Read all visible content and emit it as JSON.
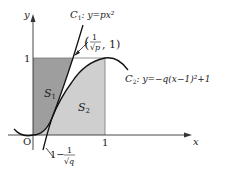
{
  "diagram": {
    "axes": {
      "x_label": "x",
      "y_label": "y",
      "origin_label": "O",
      "x_tick_1": "1",
      "y_tick_1": "1"
    },
    "curves": {
      "c1": {
        "name": "C",
        "sub": "1",
        "equation": ": y=px²"
      },
      "c2": {
        "name": "C",
        "sub": "2",
        "equation": ": y=−q(x−1)²+1"
      }
    },
    "point": {
      "open": "(",
      "num": "1",
      "den": "√p",
      "tail": ", 1)"
    },
    "x_point": {
      "lead": "1−",
      "num": "1",
      "den": "√q"
    },
    "regions": {
      "s1": {
        "name": "S",
        "sub": "1",
        "fill": "#9e9e9e"
      },
      "s2": {
        "name": "S",
        "sub": "2",
        "fill": "#cfcfcf"
      }
    }
  }
}
